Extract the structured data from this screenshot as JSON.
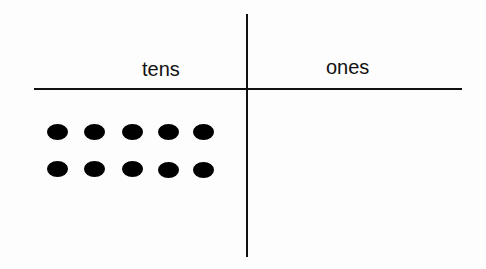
{
  "diagram": {
    "columns": [
      {
        "label": "tens",
        "count": 10
      },
      {
        "label": "ones",
        "count": 0
      }
    ],
    "dots": [
      {
        "x": 57,
        "y": 132
      },
      {
        "x": 94,
        "y": 132
      },
      {
        "x": 132,
        "y": 132
      },
      {
        "x": 168,
        "y": 132
      },
      {
        "x": 203,
        "y": 132
      },
      {
        "x": 57,
        "y": 169
      },
      {
        "x": 94,
        "y": 169
      },
      {
        "x": 132,
        "y": 169
      },
      {
        "x": 168,
        "y": 170
      },
      {
        "x": 203,
        "y": 170
      }
    ],
    "ink_color": "#111111"
  }
}
